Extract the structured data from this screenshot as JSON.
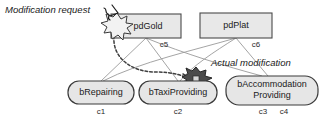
{
  "diagram": {
    "type": "feature-modification-diagram",
    "background_color": "#ffffff",
    "annotations": [
      {
        "id": "modification-request",
        "text": "Modification request",
        "style": "italic",
        "x": 5,
        "y": 13
      },
      {
        "id": "actual-modification",
        "text": "Actual modification",
        "style": "italic",
        "x": 211,
        "y": 66
      }
    ],
    "product_nodes": [
      {
        "id": "pdGold",
        "label": "pdGold",
        "shape": "rectangle",
        "fill": "#e8e8e8",
        "stroke": "#4a4a4a",
        "x": 111,
        "y": 14,
        "width": 70,
        "height": 24,
        "connector_label": "c5"
      },
      {
        "id": "pdPlat",
        "label": "pdPlat",
        "shape": "rectangle",
        "fill": "#e8e8e8",
        "stroke": "#4a4a4a",
        "x": 200,
        "y": 13,
        "width": 72,
        "height": 25,
        "connector_label": "c6"
      }
    ],
    "behavior_nodes": [
      {
        "id": "bRepairing",
        "label_lines": [
          "bRepairing"
        ],
        "shape": "rounded-rectangle",
        "fill": "#e6e6e6",
        "stroke": "#3a3a3a",
        "x": 68,
        "y": 81,
        "width": 66,
        "height": 23,
        "connector_labels": [
          "c1"
        ]
      },
      {
        "id": "bTaxiProviding",
        "label_lines": [
          "bTaxiProviding"
        ],
        "shape": "rounded-rectangle",
        "fill": "#e6e6e6",
        "stroke": "#3a3a3a",
        "x": 139,
        "y": 81,
        "width": 78,
        "height": 23,
        "connector_labels": [
          "c2"
        ]
      },
      {
        "id": "bAccommodationProviding",
        "label_lines": [
          "bAccommodation",
          "Providing"
        ],
        "shape": "rounded-rectangle",
        "fill": "#e6e6e6",
        "stroke": "#3a3a3a",
        "x": 226,
        "y": 76,
        "width": 92,
        "height": 29,
        "connector_labels": [
          "c3",
          "c4"
        ]
      }
    ],
    "connector_labels": [
      {
        "id": "c5",
        "text": "c5",
        "x": 164,
        "y": 47
      },
      {
        "id": "c6",
        "text": "c6",
        "x": 256,
        "y": 47
      },
      {
        "id": "c1",
        "text": "c1",
        "x": 101,
        "y": 114
      },
      {
        "id": "c2",
        "text": "c2",
        "x": 178,
        "y": 114
      },
      {
        "id": "c3",
        "text": "c3",
        "x": 263,
        "y": 114
      },
      {
        "id": "c4",
        "text": "c4",
        "x": 283,
        "y": 114
      }
    ],
    "markers": [
      {
        "id": "request-burst",
        "kind": "starburst",
        "tone": "light",
        "fill": "#f2f2f2",
        "cx": 117,
        "cy": 26,
        "r": 13
      },
      {
        "id": "modification-burst",
        "kind": "starburst",
        "tone": "dark",
        "fill": "#4b4b4b",
        "cx": 196,
        "cy": 79,
        "r": 12
      }
    ],
    "arrows": [
      {
        "id": "request-arrow",
        "from": "modification-request-label",
        "to": "request-burst",
        "style": "solid-hand-drawn"
      }
    ],
    "dashed_path": {
      "id": "request-to-modification",
      "from": "request-burst",
      "to": "modification-burst",
      "style": "dashed",
      "color": "#3f3f3f"
    }
  }
}
